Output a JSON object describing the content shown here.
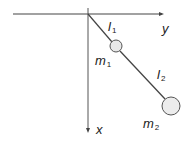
{
  "diagram": {
    "type": "double-pendulum",
    "axes": {
      "horizontal_label": "y",
      "vertical_label": "x"
    },
    "rods": [
      {
        "label": "l",
        "sub": "1"
      },
      {
        "label": "l",
        "sub": "2"
      }
    ],
    "masses": [
      {
        "label": "m",
        "sub": "1"
      },
      {
        "label": "m",
        "sub": "2"
      }
    ],
    "colors": {
      "line": "#444444",
      "mass_fill": "#e8e8e8",
      "mass_stroke": "#555555"
    }
  }
}
